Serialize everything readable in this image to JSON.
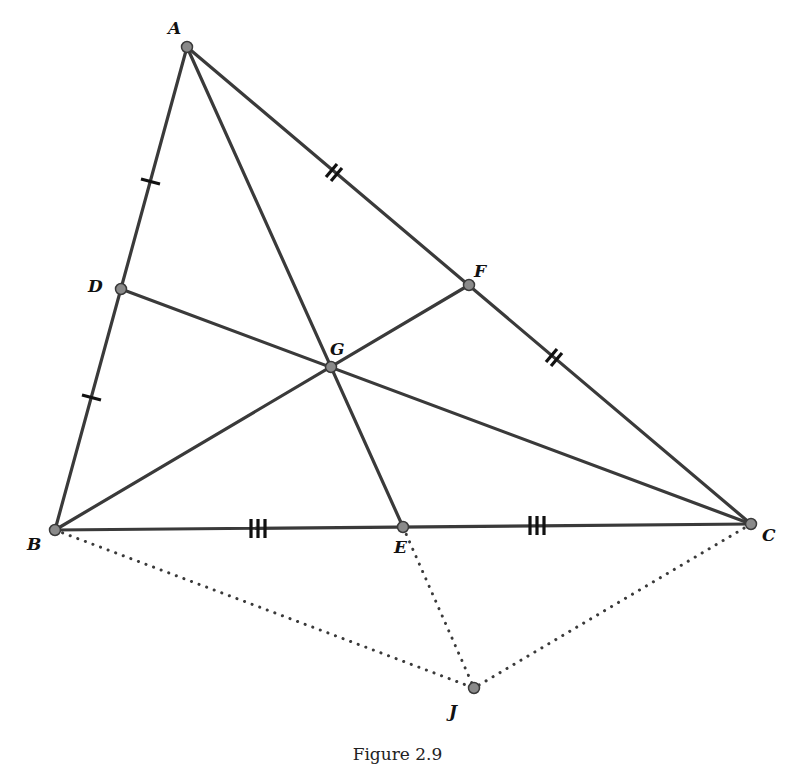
{
  "figure": {
    "caption": "Figure 2.9",
    "points": {
      "A": {
        "label": "A",
        "x": 187,
        "y": 47
      },
      "B": {
        "label": "B",
        "x": 55,
        "y": 530
      },
      "C": {
        "label": "C",
        "x": 751,
        "y": 524
      },
      "D": {
        "label": "D",
        "x": 121,
        "y": 289
      },
      "E": {
        "label": "E",
        "x": 403,
        "y": 527
      },
      "F": {
        "label": "F",
        "x": 469,
        "y": 285
      },
      "G": {
        "label": "G",
        "x": 331,
        "y": 367
      },
      "J": {
        "label": "J",
        "x": 474,
        "y": 688
      }
    },
    "solid_segments": [
      "AB",
      "BC",
      "CA",
      "AE",
      "BF",
      "CD"
    ],
    "dotted_segments": [
      "BJ",
      "EJ",
      "CJ"
    ],
    "tick_marks": [
      {
        "segment": "AD",
        "count": 1
      },
      {
        "segment": "DB",
        "count": 1
      },
      {
        "segment": "AF",
        "count": 2
      },
      {
        "segment": "FC",
        "count": 2
      },
      {
        "segment": "BE",
        "count": 3
      },
      {
        "segment": "EC",
        "count": 3
      }
    ],
    "colors": {
      "line": "#3a3a3a",
      "point_fill": "#8a8a8a",
      "background": "#ffffff"
    }
  }
}
